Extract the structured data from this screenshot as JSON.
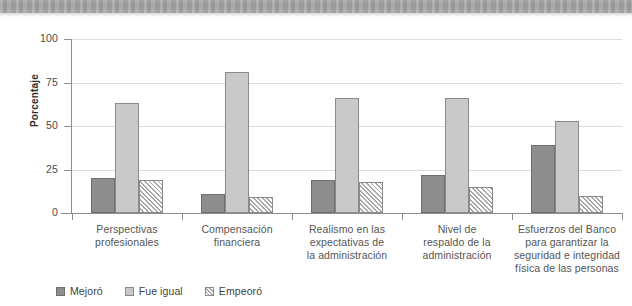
{
  "chart_data": {
    "type": "bar",
    "title": "",
    "xlabel": "",
    "ylabel": "Porcentaje",
    "ylim": [
      0,
      100
    ],
    "yticks": [
      0,
      25,
      50,
      75,
      100
    ],
    "grid": true,
    "legend_position": "bottom-left",
    "categories": [
      "Perspectivas profesionales",
      "Compensación financiera",
      "Realismo en las expectativas de la administración",
      "Nivel de respaldo de la administración",
      "Esfuerzos del Banco para garantizar la seguridad e integridad física de las personas"
    ],
    "category_lines": [
      [
        "Perspectivas",
        "profesionales"
      ],
      [
        "Compensación",
        "financiera"
      ],
      [
        "Realismo en las",
        "expectativas de",
        "la administración"
      ],
      [
        "Nivel de",
        "respaldo de la",
        "administración"
      ],
      [
        "Esfuerzos del Banco",
        "para garantizar la",
        "seguridad e integridad",
        "física de las personas"
      ]
    ],
    "series": [
      {
        "name": "Mejoró",
        "color": "#8d8d8d",
        "values": [
          20,
          11,
          19,
          22,
          39
        ]
      },
      {
        "name": "Fue igual",
        "color": "#c9c9c9",
        "values": [
          63,
          81,
          66,
          66,
          53
        ]
      },
      {
        "name": "Empeoró",
        "color": "#ffffff",
        "values": [
          19,
          9,
          18,
          15,
          10
        ]
      }
    ]
  },
  "axis": {
    "y_title": "Porcentaje",
    "y_labels": [
      "100",
      "75",
      "50",
      "25",
      "0"
    ]
  },
  "legend": {
    "items": [
      {
        "label": "Mejoró",
        "swatch": "solid-dark-gray"
      },
      {
        "label": "Fue igual",
        "swatch": "solid-light-gray"
      },
      {
        "label": "Empeoró",
        "swatch": "diagonal-hatch"
      }
    ]
  }
}
